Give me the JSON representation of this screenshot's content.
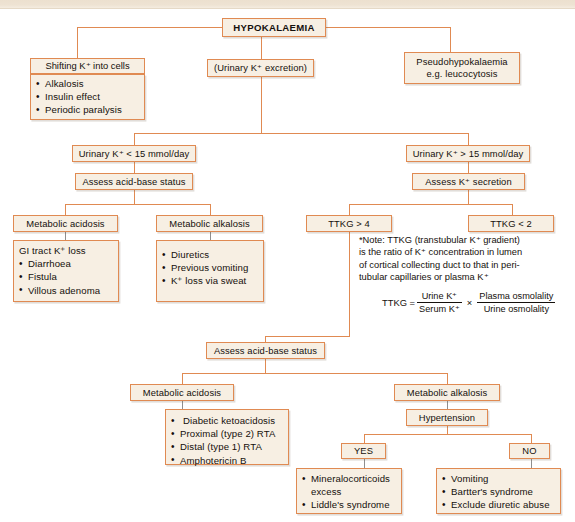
{
  "diagram": {
    "colors": {
      "border": "#e08a52",
      "fill": "#f7efe3",
      "text": "#15100c",
      "gray_connector": "#8e8e8e"
    },
    "root": "HYPOKALAEMIA",
    "nodes": {
      "hypokalaemia": "HYPOKALAEMIA",
      "shifting_header": "Shifting K⁺ into cells",
      "shifting_items": [
        "Alkalosis",
        "Insulin effect",
        "Periodic paralysis"
      ],
      "urinary_excretion": "(Urinary K⁺ excretion)",
      "pseudo_line1": "Pseudohypokalaemia",
      "pseudo_line2": "e.g. leucocytosis",
      "urinary_low": "Urinary K⁺  < 15 mmol/day",
      "urinary_high": "Urinary K⁺  > 15 mmol/day",
      "assess_acid_base_upper": "Assess acid-base status",
      "assess_k_secretion": "Assess K⁺ secretion",
      "metabolic_acidosis_upper": "Metabolic acidosis",
      "metabolic_alkalosis_upper": "Metabolic alkalosis",
      "gi_tract_header": "GI tract K⁺ loss",
      "gi_tract_items": [
        "Diarrhoea",
        "Fistula",
        "Villous adenoma"
      ],
      "alkalosis_items": [
        "Diuretics",
        "Previous vomiting",
        "K⁺ loss via sweat"
      ],
      "ttkg_high": "TTKG > 4",
      "ttkg_low": "TTKG < 2",
      "assess_acid_base_lower": "Assess acid-base status",
      "metabolic_acidosis_lower": "Metabolic acidosis",
      "metabolic_alkalosis_lower": "Metabolic alkalosis",
      "acidosis_lower_items": [
        "Diabetic ketoacidosis",
        "Proximal (type 2) RTA",
        "Distal (type 1) RTA",
        "Amphotericin B"
      ],
      "hypertension": "Hypertension",
      "yes": "YES",
      "no": "NO",
      "yes_items": [
        "Mineralocorticoids",
        "excess",
        "Liddle's syndrome"
      ],
      "no_items": [
        "Vomiting",
        "Bartter's syndrome",
        "Exclude diuretic abuse"
      ]
    },
    "note": {
      "line1": "*Note: TTKG (transtubular K⁺ gradient)",
      "line2": "is the ratio of K⁺ concentration in lumen",
      "line3": "of cortical collecting duct to that in peri-",
      "line4": "tubular capillaries or plasma K⁺",
      "formula_label": "TTKG =",
      "formula_f1_num": "Urine K⁺",
      "formula_f1_den": "Serum K⁺",
      "formula_operator": "×",
      "formula_f2_num": "Plasma osmolality",
      "formula_f2_den": "Urine osmolality"
    }
  }
}
